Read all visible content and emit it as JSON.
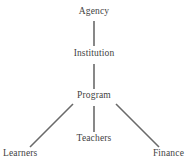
{
  "diagram": {
    "type": "hierarchy-tree",
    "background_color": "#ffffff",
    "edge_color": "#6a6a6a",
    "text_color": "#3f3f3f",
    "nodes": [
      {
        "id": "agency",
        "label": "Agency",
        "level": 0
      },
      {
        "id": "institution",
        "label": "Institution",
        "level": 1
      },
      {
        "id": "program",
        "label": "Program",
        "level": 2
      },
      {
        "id": "learners",
        "label": "Learners",
        "level": 3
      },
      {
        "id": "teachers",
        "label": "Teachers",
        "level": 3
      },
      {
        "id": "finance",
        "label": "Finance",
        "level": 3
      }
    ],
    "edges": [
      {
        "from": "agency",
        "to": "institution",
        "style": "vertical"
      },
      {
        "from": "institution",
        "to": "program",
        "style": "vertical"
      },
      {
        "from": "program",
        "to": "learners",
        "style": "diagonal-left"
      },
      {
        "from": "program",
        "to": "teachers",
        "style": "vertical"
      },
      {
        "from": "program",
        "to": "finance",
        "style": "diagonal-right"
      }
    ]
  }
}
